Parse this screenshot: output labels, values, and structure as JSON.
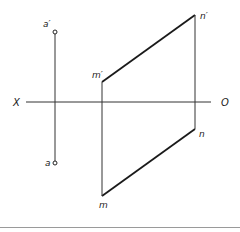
{
  "diagram": {
    "type": "orthographic-projection",
    "colors": {
      "line": "#1a1a1a",
      "thin_line": "#333333",
      "divider": "#9a9a9a",
      "label": "#222222",
      "background": "#ffffff"
    },
    "axis": {
      "left_label": "X",
      "right_label": "O"
    },
    "points": {
      "a_prime": {
        "label": "a′"
      },
      "a": {
        "label": "a"
      },
      "m_prime": {
        "label": "m′"
      },
      "m": {
        "label": "m"
      },
      "n_prime": {
        "label": "n′"
      },
      "n": {
        "label": "n"
      }
    }
  }
}
